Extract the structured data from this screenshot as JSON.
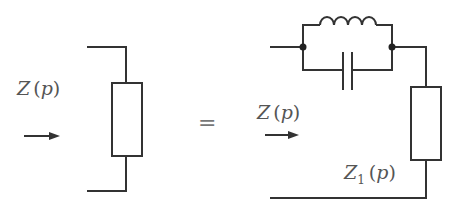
{
  "diagram": {
    "type": "circuit-equivalence",
    "colors": {
      "wire": "#333333",
      "label": "#555555"
    },
    "left": {
      "label": {
        "var": "Z",
        "open": "(",
        "arg": "p",
        "close": ")"
      },
      "component": "resistor-impedance"
    },
    "equals": "=",
    "right": {
      "label": {
        "var": "Z",
        "open": "(",
        "arg": "p",
        "close": ")"
      },
      "sub_label": {
        "var": "Z",
        "sub": "1",
        "open": "(",
        "arg": "p",
        "close": ")"
      },
      "components": [
        "inductor",
        "capacitor",
        "resistor-impedance"
      ]
    }
  }
}
